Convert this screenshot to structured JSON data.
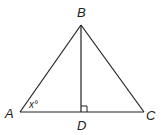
{
  "diagram": {
    "title": "",
    "stroke_color": "#222222",
    "background": "#ffffff",
    "vertices": {
      "A": {
        "label": "A",
        "x": 20,
        "y": 112
      },
      "B": {
        "label": "B",
        "x": 81,
        "y": 25
      },
      "C": {
        "label": "C",
        "x": 144,
        "y": 112
      },
      "D": {
        "label": "D",
        "x": 81,
        "y": 112
      }
    },
    "segments": [
      {
        "from": "A",
        "to": "B"
      },
      {
        "from": "B",
        "to": "C"
      },
      {
        "from": "A",
        "to": "C"
      },
      {
        "from": "B",
        "to": "D"
      }
    ],
    "angle_labels": {
      "A": {
        "text": "x°"
      }
    },
    "right_angle_marker": {
      "at": "D",
      "size": 6
    }
  }
}
